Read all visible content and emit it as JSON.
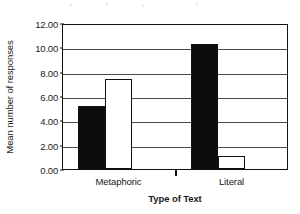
{
  "chart_data": {
    "type": "bar",
    "title": "",
    "xlabel": "Type of Text",
    "ylabel": "Mean number of responses",
    "categories": [
      "Metaphoric",
      "Literal"
    ],
    "series": [
      {
        "name": "black",
        "values": [
          5.2,
          10.3
        ]
      },
      {
        "name": "white",
        "values": [
          7.4,
          1.1
        ]
      }
    ],
    "ylim": [
      0,
      12
    ],
    "ytick_step": 2,
    "ytick_labels": [
      "0.00",
      "2.00",
      "4.00",
      "6.00",
      "8.00",
      "10.00",
      "12.00"
    ],
    "ytick_values": [
      0,
      2,
      4,
      6,
      8,
      10,
      12
    ],
    "grid": "horizontal",
    "legend": "none",
    "colors": {
      "series_black": "#0d0d0d",
      "series_white": "#ffffff",
      "axis": "#111111",
      "gridline": "#4a4a4a",
      "background": "#ffffff"
    }
  }
}
